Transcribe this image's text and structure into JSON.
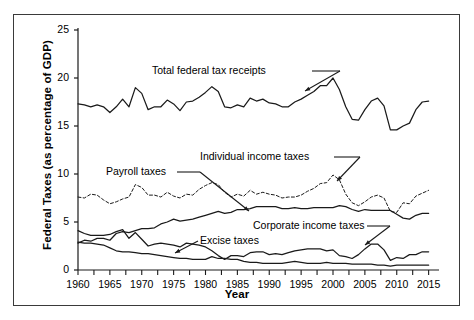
{
  "figure": {
    "background_color": "#ffffff",
    "frame_color": "#3a3a3a",
    "line_color": "#1a1a1a"
  },
  "chart_data": {
    "type": "line",
    "title": "",
    "xlabel": "Year",
    "ylabel": "Federal Taxes (as percentage of GDP)",
    "xlim": [
      1960,
      2016
    ],
    "ylim": [
      0,
      25
    ],
    "yticks": [
      0,
      5,
      10,
      15,
      20,
      25
    ],
    "ytick_labels": [
      "0",
      "5",
      "10",
      "15",
      "20",
      "25"
    ],
    "xticks": [
      1960,
      1965,
      1970,
      1975,
      1980,
      1985,
      1990,
      1995,
      2000,
      2005,
      2010,
      2015
    ],
    "xtick_labels": [
      "1960",
      "1965",
      "1970",
      "1975",
      "1980",
      "1985",
      "1990",
      "1995",
      "2000",
      "2005",
      "2010",
      "2015"
    ],
    "minor_xtick_step": 2.5,
    "grid": false,
    "legend_position": "inline-annotations",
    "x": [
      1960,
      1961,
      1962,
      1963,
      1964,
      1965,
      1966,
      1967,
      1968,
      1969,
      1970,
      1971,
      1972,
      1973,
      1974,
      1975,
      1976,
      1977,
      1978,
      1979,
      1980,
      1981,
      1982,
      1983,
      1984,
      1985,
      1986,
      1987,
      1988,
      1989,
      1990,
      1991,
      1992,
      1993,
      1994,
      1995,
      1996,
      1997,
      1998,
      1999,
      2000,
      2001,
      2002,
      2003,
      2004,
      2005,
      2006,
      2007,
      2008,
      2009,
      2010,
      2011,
      2012,
      2013,
      2014,
      2015
    ],
    "series": [
      {
        "name": "Total federal tax receipts",
        "style": "solid",
        "values": [
          17.3,
          17.2,
          17.0,
          17.2,
          17.0,
          16.4,
          17.0,
          17.8,
          17.0,
          19.0,
          18.4,
          16.7,
          17.0,
          17.0,
          17.7,
          17.3,
          16.6,
          17.5,
          17.6,
          18.0,
          18.5,
          19.1,
          18.6,
          17.0,
          16.9,
          17.2,
          17.0,
          17.9,
          17.6,
          17.8,
          17.4,
          17.3,
          17.0,
          17.0,
          17.5,
          17.8,
          18.2,
          18.6,
          19.2,
          19.2,
          20.0,
          18.8,
          17.0,
          15.7,
          15.6,
          16.7,
          17.6,
          17.9,
          17.1,
          14.6,
          14.6,
          15.0,
          15.3,
          16.7,
          17.5,
          17.6
        ]
      },
      {
        "name": "Individual income taxes",
        "style": "dashed",
        "values": [
          7.6,
          7.5,
          7.9,
          7.8,
          7.3,
          6.9,
          7.1,
          7.4,
          7.6,
          8.9,
          8.6,
          7.8,
          7.8,
          7.6,
          8.1,
          7.7,
          7.5,
          7.9,
          7.8,
          8.4,
          8.8,
          9.1,
          8.9,
          8.1,
          7.6,
          7.9,
          7.7,
          8.3,
          7.9,
          8.1,
          7.9,
          7.8,
          7.5,
          7.6,
          7.6,
          7.8,
          8.2,
          8.5,
          9.0,
          9.1,
          9.9,
          9.4,
          7.9,
          7.0,
          6.7,
          7.1,
          7.6,
          7.8,
          7.5,
          6.1,
          6.0,
          7.0,
          6.9,
          7.7,
          8.0,
          8.3
        ]
      },
      {
        "name": "Payroll taxes",
        "style": "solid",
        "values": [
          2.8,
          3.1,
          3.0,
          3.3,
          3.3,
          3.1,
          3.8,
          4.0,
          3.9,
          4.1,
          4.3,
          4.3,
          4.4,
          4.8,
          5.0,
          5.3,
          5.1,
          5.2,
          5.3,
          5.5,
          5.7,
          5.9,
          6.1,
          5.9,
          6.0,
          6.3,
          6.3,
          6.4,
          6.6,
          6.6,
          6.6,
          6.6,
          6.4,
          6.4,
          6.5,
          6.4,
          6.4,
          6.5,
          6.5,
          6.5,
          6.5,
          6.7,
          6.6,
          6.3,
          6.1,
          6.3,
          6.2,
          6.2,
          6.2,
          6.2,
          5.8,
          5.4,
          5.3,
          5.7,
          5.9,
          5.9
        ]
      },
      {
        "name": "Corporate income taxes",
        "style": "solid",
        "values": [
          4.1,
          3.8,
          3.6,
          3.6,
          3.6,
          3.7,
          4.0,
          4.2,
          3.3,
          3.9,
          3.2,
          2.5,
          2.7,
          2.8,
          2.7,
          2.6,
          2.4,
          2.8,
          2.7,
          2.6,
          2.4,
          2.0,
          1.5,
          1.1,
          1.5,
          1.5,
          1.4,
          1.8,
          1.9,
          1.9,
          1.6,
          1.7,
          1.6,
          1.8,
          2.0,
          2.1,
          2.2,
          2.2,
          2.2,
          2.0,
          2.1,
          1.5,
          1.4,
          1.2,
          1.6,
          2.2,
          2.7,
          2.7,
          2.1,
          1.0,
          1.3,
          1.2,
          1.6,
          1.6,
          1.9,
          1.9
        ]
      },
      {
        "name": "Excise taxes",
        "style": "solid",
        "values": [
          2.9,
          2.8,
          2.8,
          2.7,
          2.6,
          2.3,
          2.0,
          1.9,
          1.9,
          1.8,
          1.7,
          1.7,
          1.6,
          1.5,
          1.4,
          1.3,
          1.2,
          1.2,
          1.1,
          1.1,
          1.1,
          1.4,
          1.2,
          1.2,
          1.1,
          1.1,
          0.9,
          0.8,
          0.8,
          0.7,
          0.7,
          0.7,
          0.7,
          0.8,
          0.9,
          0.8,
          0.7,
          0.7,
          0.7,
          0.8,
          0.7,
          0.7,
          0.7,
          0.6,
          0.6,
          0.6,
          0.6,
          0.5,
          0.5,
          0.4,
          0.5,
          0.5,
          0.5,
          0.5,
          0.5,
          0.5
        ]
      }
    ]
  },
  "annotations": [
    {
      "id": "total-federal-tax-receipts",
      "text": "Total federal tax receipts"
    },
    {
      "id": "individual-income-taxes",
      "text": "Individual income taxes"
    },
    {
      "id": "payroll-taxes",
      "text": "Payroll taxes"
    },
    {
      "id": "corporate-income-taxes",
      "text": "Corporate income taxes"
    },
    {
      "id": "excise-taxes",
      "text": "Excise taxes"
    }
  ]
}
